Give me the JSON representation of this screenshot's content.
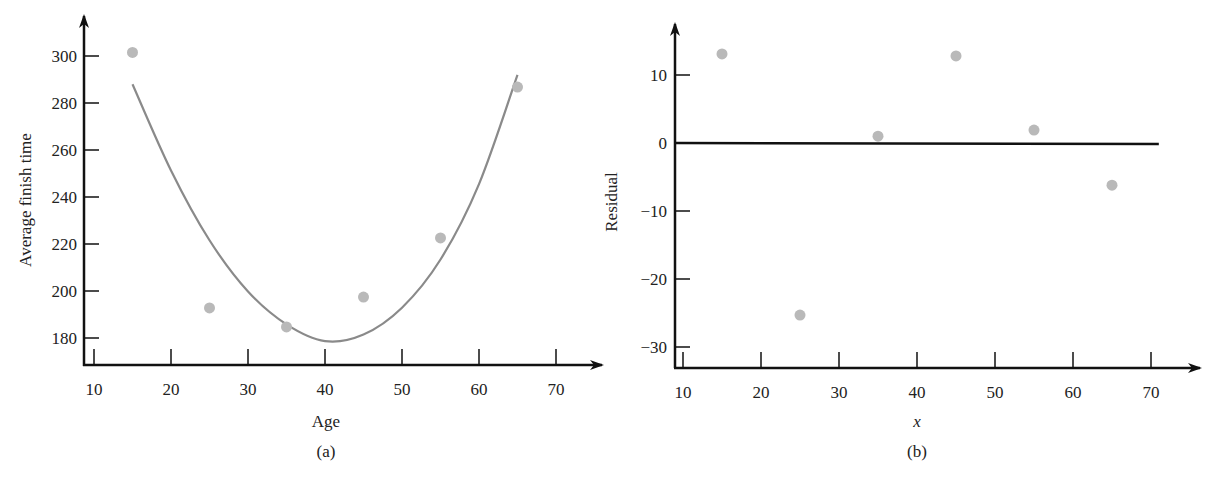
{
  "chart_data": [
    {
      "type": "scatter",
      "panel": "(a)",
      "caption": "(a)",
      "title": "",
      "xlabel": "Age",
      "ylabel": "Average finish time",
      "xlim": [
        8,
        75
      ],
      "ylim": [
        170,
        315
      ],
      "xticks": [
        10,
        20,
        30,
        40,
        50,
        60,
        70
      ],
      "yticks": [
        180,
        200,
        220,
        240,
        260,
        280,
        300
      ],
      "grid": false,
      "series": [
        {
          "name": "observed",
          "type": "scatter",
          "color": "#b9b9b9",
          "x": [
            15,
            25,
            35,
            45,
            55,
            65
          ],
          "y": [
            301.5,
            192.8,
            184.7,
            197.4,
            222.6,
            286.8
          ]
        },
        {
          "name": "quadratic fit",
          "type": "line",
          "color": "#8a8a8a",
          "x": [
            15,
            20,
            25,
            30,
            35,
            40,
            45,
            50,
            55,
            60,
            65
          ],
          "y": [
            288,
            251.3,
            221.6,
            199.8,
            185.8,
            178.7,
            181.5,
            192.9,
            213.4,
            245.5,
            292
          ]
        }
      ]
    },
    {
      "type": "scatter",
      "panel": "(b)",
      "caption": "(b)",
      "title": "",
      "xlabel": "x",
      "ylabel": "Residual",
      "xlim": [
        8,
        75
      ],
      "ylim": [
        -33,
        17
      ],
      "xticks": [
        10,
        20,
        30,
        40,
        50,
        60,
        70
      ],
      "yticks": [
        -30,
        -20,
        -10,
        0,
        10
      ],
      "grid": false,
      "reference_line": {
        "y": 0,
        "x_from": 10,
        "x_to": 71
      },
      "series": [
        {
          "name": "residuals",
          "type": "scatter",
          "color": "#b9b9b9",
          "x": [
            15,
            25,
            35,
            45,
            55,
            65
          ],
          "y": [
            13.1,
            -25.3,
            1.0,
            12.8,
            1.9,
            -6.2
          ]
        }
      ]
    }
  ]
}
